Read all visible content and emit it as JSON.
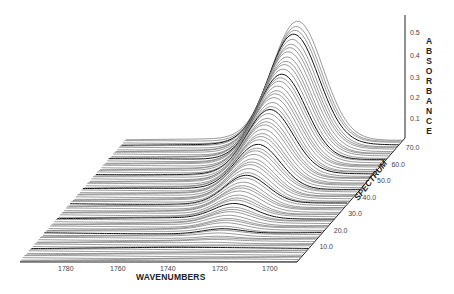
{
  "chart_data": {
    "type": "waterfall-3d-line",
    "title": "",
    "xlabel": "WAVENUMBERS",
    "ylabel": "SPECTRUM",
    "zlabel": "ABSORBANCE",
    "x_ticks": [
      "1780",
      "1760",
      "1740",
      "1720",
      "1700"
    ],
    "y_ticks": [
      "10.0",
      "20.0",
      "30.0",
      "40.0",
      "50.0",
      "60.0",
      "70.0"
    ],
    "z_ticks": [
      "0.1",
      "0.2",
      "0.3",
      "0.4",
      "0.5"
    ],
    "x_range": [
      1790,
      1690
    ],
    "y_range": [
      1,
      75
    ],
    "z_range": [
      0.0,
      0.55
    ],
    "n_spectra": 75,
    "peak_center_wavenumber": 1725,
    "peak_max_absorbance": 0.55,
    "grid": false,
    "legend": "none"
  },
  "labels": {
    "xlabel": "WAVENUMBERS",
    "ylabel": "SPECTRUM",
    "zlabel": "ABSORBANCE"
  }
}
